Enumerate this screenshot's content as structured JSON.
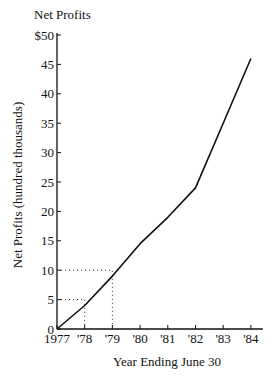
{
  "top_fragment": "ngs of a company over the years",
  "chart_data": {
    "type": "line",
    "title": "Net Profits",
    "xlabel": "Year Ending June 30",
    "ylabel": "Net Profits (hundred thousands)",
    "categories": [
      "1977",
      "'78",
      "'79",
      "'80",
      "'81",
      "'82",
      "'83",
      "'84"
    ],
    "x": [
      1977,
      1978,
      1979,
      1980,
      1981,
      1982,
      1983,
      1984
    ],
    "series": [
      {
        "name": "Net Profits",
        "values": [
          0,
          4,
          9,
          14.5,
          19,
          24,
          35,
          46
        ]
      }
    ],
    "y_ticks": [
      "0",
      "5",
      "10",
      "15",
      "20",
      "25",
      "30",
      "35",
      "40",
      "45",
      "$50"
    ],
    "ylim": [
      0,
      50
    ],
    "grid": false,
    "legend": "none",
    "annotations": [
      {
        "type": "dotted-guide",
        "x": 1978,
        "y": 5
      },
      {
        "type": "dotted-guide",
        "x": 1979,
        "y": 10
      }
    ]
  }
}
